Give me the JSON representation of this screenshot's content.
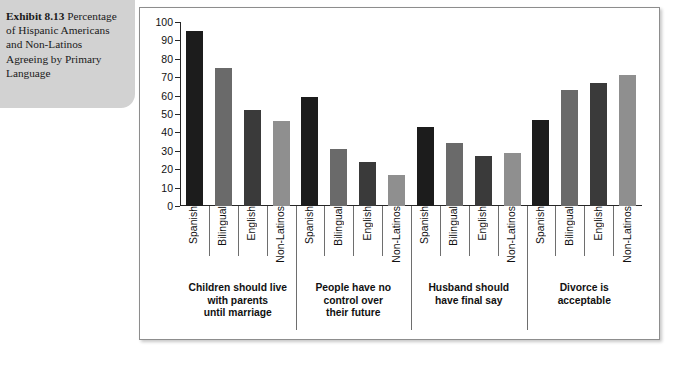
{
  "caption": {
    "lead": "Exhibit 8.13",
    "rest": " Percentage of Hispanic Americans and Non-Latinos Agreeing by Primary Language"
  },
  "chart_data": {
    "type": "bar",
    "title": "",
    "xlabel": "",
    "ylabel": "",
    "ylim": [
      0,
      100
    ],
    "yticks": [
      0,
      10,
      20,
      30,
      40,
      50,
      60,
      70,
      80,
      90,
      100
    ],
    "grid": false,
    "legend": "none",
    "categories": [
      "Spanish",
      "Bilingual",
      "English",
      "Non-Latinos"
    ],
    "groups": [
      {
        "label": "Children should live with parents until marriage",
        "lines": [
          "Children should live",
          "with parents",
          "until marriage"
        ],
        "values": [
          95,
          75,
          52,
          46
        ]
      },
      {
        "label": "People have no control over their future",
        "lines": [
          "People have no",
          "control over",
          "their future"
        ],
        "values": [
          59,
          31,
          24,
          17
        ]
      },
      {
        "label": "Husband should have final say",
        "lines": [
          "Husband should",
          "have final say"
        ],
        "values": [
          43,
          34,
          27,
          29
        ]
      },
      {
        "label": "Divorce is acceptable",
        "lines": [
          "Divorce is",
          "acceptable"
        ],
        "values": [
          47,
          63,
          67,
          71
        ]
      }
    ],
    "series_colors": [
      "#1c1c1c",
      "#6a6a6a",
      "#3a3a3a",
      "#8f8f8f"
    ]
  }
}
